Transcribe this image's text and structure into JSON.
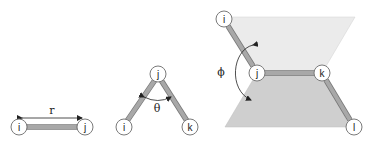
{
  "figure": {
    "panels": [
      {
        "name": "bond-length",
        "atoms": [
          "i",
          "j"
        ],
        "parameter": "r"
      },
      {
        "name": "bond-angle",
        "atoms": [
          "i",
          "j",
          "k"
        ],
        "parameter": "θ"
      },
      {
        "name": "dihedral-angle",
        "atoms": [
          "i",
          "j",
          "k",
          "l"
        ],
        "parameter": "ϕ"
      }
    ]
  },
  "colors": {
    "bond_fill": "#a8a8a8",
    "bond_edge": "#777777",
    "upper_plane": "#ebebeb",
    "lower_plane": "#cfcfcf",
    "atom_stroke": "#7a7a7a",
    "text": "#222222"
  }
}
